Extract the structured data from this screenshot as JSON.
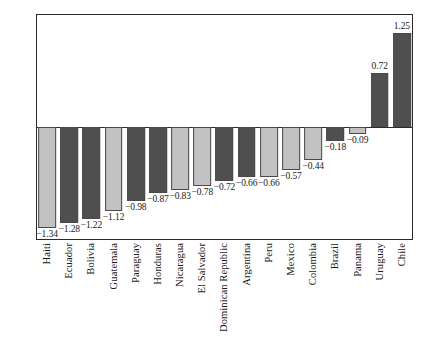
{
  "chart_data": {
    "type": "bar",
    "title": "",
    "subtitle": "",
    "xlabel": "",
    "ylabel": "",
    "ylim": [
      -1.5,
      1.5
    ],
    "yticks": [
      "-1.5",
      "-1.0",
      "-0.5",
      "0.0",
      "0.5",
      "1.0",
      "1.5"
    ],
    "ytick_values": [
      -1.5,
      -1.0,
      -0.5,
      0.0,
      0.5,
      1.0,
      1.5
    ],
    "grid": false,
    "legend": "none",
    "categories": [
      "Haiti",
      "Ecuador",
      "Bolivia",
      "Guatemala",
      "Paraguay",
      "Honduras",
      "Nicaragua",
      "El Salvador",
      "Dominican Republic",
      "Argentina",
      "Peru",
      "Mexico",
      "Colombia",
      "Brazil",
      "Panama",
      "Uruguay",
      "Chile"
    ],
    "values": [
      -1.34,
      -1.28,
      -1.22,
      -1.12,
      -0.98,
      -0.87,
      -0.83,
      -0.78,
      -0.72,
      -0.66,
      -0.66,
      -0.57,
      -0.44,
      -0.18,
      -0.09,
      0.72,
      1.25
    ],
    "data_labels": [
      "-1.34",
      "-1.28",
      "-1.22",
      "-1.12",
      "-0.98",
      "-0.87",
      "-0.83",
      "-0.78",
      "-0.72",
      "-0.66",
      "-0.66",
      "-0.57",
      "-0.44",
      "-0.18",
      "-0.09",
      "0.72",
      "1.25"
    ],
    "bar_shades": [
      "light",
      "dark",
      "dark",
      "light",
      "dark",
      "dark",
      "light",
      "light",
      "dark",
      "dark",
      "light",
      "light",
      "light",
      "dark",
      "light",
      "dark",
      "dark"
    ],
    "colors": {
      "light": "#c2c2c2",
      "dark": "#4f4f4f",
      "bar_edge": "#4a4a4a",
      "axis": "#2b2b2b",
      "text": "#1a1a1a",
      "background": "#ffffff"
    }
  }
}
